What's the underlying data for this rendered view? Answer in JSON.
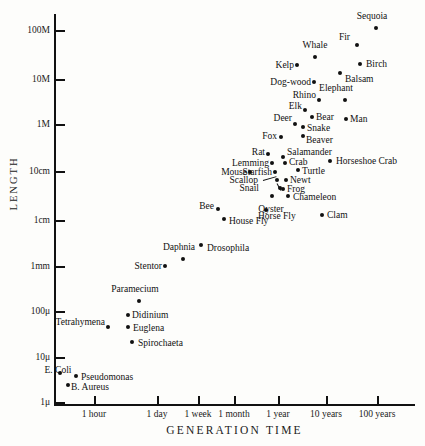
{
  "chart_data": {
    "type": "scatter",
    "title": "",
    "xlabel": "GENERATION TIME",
    "ylabel": "LENGTH",
    "grid": false,
    "legend": "none",
    "x_scale": "log",
    "y_scale": "log",
    "x_tick_labels": [
      "1 hour",
      "1 day",
      "1 week",
      "1 month",
      "1 year",
      "10 years",
      "100 years"
    ],
    "x_tick_px": [
      94,
      157,
      198,
      234,
      278,
      326,
      377
    ],
    "y_tick_labels": [
      "100M",
      "10M",
      "1M",
      "10cm",
      "1cm",
      "1mm",
      "100μ",
      "10μ",
      "1μ"
    ],
    "y_tick_px": [
      31,
      80,
      125,
      172,
      221,
      267,
      312,
      358,
      403
    ],
    "points": [
      {
        "name": "Sequoia",
        "x": 376,
        "y": 28,
        "lx": 372,
        "ly": 21,
        "anchor": "above"
      },
      {
        "name": "Fir",
        "x": 357,
        "y": 45,
        "lx": 350,
        "ly": 37,
        "anchor": "left"
      },
      {
        "name": "Whale",
        "x": 315,
        "y": 57,
        "lx": 315,
        "ly": 50,
        "anchor": "above"
      },
      {
        "name": "Birch",
        "x": 360,
        "y": 64,
        "lx": 366,
        "ly": 64,
        "anchor": "right"
      },
      {
        "name": "Kelp",
        "x": 297,
        "y": 65,
        "lx": 294,
        "ly": 65,
        "anchor": "left"
      },
      {
        "name": "Dog-wood",
        "x": 314,
        "y": 82,
        "lx": 311,
        "ly": 82,
        "anchor": "left"
      },
      {
        "name": "Balsam",
        "x": 340,
        "y": 73,
        "lx": 345,
        "ly": 79,
        "anchor": "right"
      },
      {
        "name": "Elephant",
        "x": 345,
        "y": 100,
        "lx": 336,
        "ly": 93,
        "anchor": "above"
      },
      {
        "name": "Rhino",
        "x": 319,
        "y": 100,
        "lx": 316,
        "ly": 95,
        "anchor": "left"
      },
      {
        "name": "Elk",
        "x": 305,
        "y": 110,
        "lx": 302,
        "ly": 106,
        "anchor": "left"
      },
      {
        "name": "Bear",
        "x": 312,
        "y": 117,
        "lx": 316,
        "ly": 117,
        "anchor": "right"
      },
      {
        "name": "Deer",
        "x": 295,
        "y": 124,
        "lx": 292,
        "ly": 118,
        "anchor": "left"
      },
      {
        "name": "Man",
        "x": 346,
        "y": 119,
        "lx": 350,
        "ly": 119,
        "anchor": "right"
      },
      {
        "name": "Snake",
        "x": 303,
        "y": 127,
        "lx": 307,
        "ly": 128,
        "anchor": "right"
      },
      {
        "name": "Beaver",
        "x": 303,
        "y": 136,
        "lx": 306,
        "ly": 140,
        "anchor": "right"
      },
      {
        "name": "Fox",
        "x": 281,
        "y": 137,
        "lx": 277,
        "ly": 136,
        "anchor": "left"
      },
      {
        "name": "Rat",
        "x": 268,
        "y": 154,
        "lx": 265,
        "ly": 152,
        "anchor": "left"
      },
      {
        "name": "Salamander",
        "x": 283,
        "y": 157,
        "lx": 287,
        "ly": 152,
        "anchor": "right"
      },
      {
        "name": "Crab",
        "x": 285,
        "y": 163,
        "lx": 289,
        "ly": 162,
        "anchor": "right"
      },
      {
        "name": "Horseshoe Crab",
        "x": 330,
        "y": 161,
        "lx": 336,
        "ly": 161,
        "anchor": "right"
      },
      {
        "name": "Lemming",
        "x": 272,
        "y": 163,
        "lx": 269,
        "ly": 163,
        "anchor": "left"
      },
      {
        "name": "Mouse",
        "x": 250,
        "y": 172,
        "lx": 247,
        "ly": 172,
        "anchor": "left"
      },
      {
        "name": "Starfish",
        "x": 275,
        "y": 172,
        "lx": 272,
        "ly": 172,
        "anchor": "left"
      },
      {
        "name": "Turtle",
        "x": 298,
        "y": 170,
        "lx": 302,
        "ly": 171,
        "anchor": "right"
      },
      {
        "name": "Scallop",
        "x": 277,
        "y": 180,
        "lx": 258,
        "ly": 180,
        "anchor": "left"
      },
      {
        "name": "Newt",
        "x": 286,
        "y": 180,
        "lx": 290,
        "ly": 180,
        "anchor": "right"
      },
      {
        "name": "Snail",
        "x": 280,
        "y": 188,
        "lx": 259,
        "ly": 188,
        "anchor": "left"
      },
      {
        "name": "Frog",
        "x": 283,
        "y": 189,
        "lx": 287,
        "ly": 189,
        "anchor": "right"
      },
      {
        "name": "Chameleon",
        "x": 288,
        "y": 196,
        "lx": 293,
        "ly": 197,
        "anchor": "right"
      },
      {
        "name": "Oyster",
        "x": 272,
        "y": 196,
        "lx": 271,
        "ly": 204,
        "anchor": "below"
      },
      {
        "name": "Bee",
        "x": 218,
        "y": 209,
        "lx": 214,
        "ly": 206,
        "anchor": "left"
      },
      {
        "name": "Horse Fly",
        "x": 266,
        "y": 210,
        "lx": 258,
        "ly": 216,
        "anchor": "right"
      },
      {
        "name": "Clam",
        "x": 322,
        "y": 215,
        "lx": 327,
        "ly": 215,
        "anchor": "right"
      },
      {
        "name": "House Fly",
        "x": 224,
        "y": 219,
        "lx": 229,
        "ly": 221,
        "anchor": "right"
      },
      {
        "name": "Drosophila",
        "x": 201,
        "y": 245,
        "lx": 207,
        "ly": 248,
        "anchor": "right"
      },
      {
        "name": "Daphnia",
        "x": 183,
        "y": 259,
        "lx": 179,
        "ly": 252,
        "anchor": "above"
      },
      {
        "name": "Stentor",
        "x": 165,
        "y": 266,
        "lx": 162,
        "ly": 266,
        "anchor": "left"
      },
      {
        "name": "Paramecium",
        "x": 139,
        "y": 301,
        "lx": 135,
        "ly": 294,
        "anchor": "above"
      },
      {
        "name": "Didinium",
        "x": 128,
        "y": 315,
        "lx": 132,
        "ly": 315,
        "anchor": "right"
      },
      {
        "name": "Tetrahymena",
        "x": 108,
        "y": 327,
        "lx": 105,
        "ly": 322,
        "anchor": "left"
      },
      {
        "name": "Euglena",
        "x": 128,
        "y": 327,
        "lx": 133,
        "ly": 328,
        "anchor": "right"
      },
      {
        "name": "Spirochaeta",
        "x": 132,
        "y": 342,
        "lx": 138,
        "ly": 343,
        "anchor": "right"
      },
      {
        "name": "E. Coli",
        "x": 60,
        "y": 373,
        "lx": 58,
        "ly": 365,
        "anchor": "below"
      },
      {
        "name": "Pseudomonas",
        "x": 76,
        "y": 376,
        "lx": 81,
        "ly": 377,
        "anchor": "right"
      },
      {
        "name": "B. Aureus",
        "x": 68,
        "y": 385,
        "lx": 71,
        "ly": 387,
        "anchor": "right"
      }
    ],
    "leaders": [
      {
        "x": 263,
        "y": 180,
        "width": 14,
        "rotate": -16
      },
      {
        "x": 277,
        "y": 183,
        "width": 8,
        "rotate": 62
      }
    ]
  }
}
